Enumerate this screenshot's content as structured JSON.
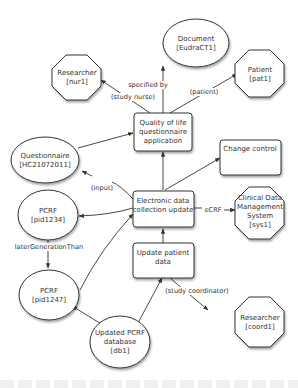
{
  "nodes": {
    "document": {
      "lines": [
        "Document",
        "[EudraCT1]"
      ],
      "shape": "ellipse"
    },
    "researcher_nur1": {
      "lines": [
        "Researcher",
        "[nur1]"
      ],
      "shape": "octagon"
    },
    "patient": {
      "lines": [
        "Patient",
        "[pat1]"
      ],
      "shape": "octagon"
    },
    "qol_app": {
      "lines": [
        "Quality of life",
        "questionnaire",
        "application"
      ],
      "shape": "box"
    },
    "questionnaire": {
      "lines": [
        "Questionnaire",
        "[HC21072011]"
      ],
      "shape": "ellipse"
    },
    "change_control": {
      "lines": [
        "Change control"
      ],
      "shape": "box"
    },
    "edc_update": {
      "lines": [
        "Electronic data",
        "collection update"
      ],
      "shape": "box"
    },
    "cdms": {
      "lines": [
        "Clinical Data",
        "Management",
        "System",
        "[sys1]"
      ],
      "shape": "octagon"
    },
    "pcrf_1234": {
      "lines": [
        "PCRF",
        "[pid1234]"
      ],
      "shape": "ellipse"
    },
    "update_patient": {
      "lines": [
        "Update patient",
        "data"
      ],
      "shape": "box"
    },
    "pcrf_1247": {
      "lines": [
        "PCRF",
        "[pid1247]"
      ],
      "shape": "ellipse"
    },
    "pcrf_db": {
      "lines": [
        "Updated PCRF",
        "database",
        "[db1]"
      ],
      "shape": "ellipse"
    },
    "researcher_coord1": {
      "lines": [
        "Researcher",
        "[coord1]"
      ],
      "shape": "octagon"
    }
  },
  "edges": {
    "specified_by": "specified by",
    "study_nurse": "(study nurse)",
    "patient": "(patient)",
    "input": "(input)",
    "ecrf": "eCRF",
    "later_generation": "laterGenerationThan",
    "study_coordinator": "(study coordinator)"
  }
}
